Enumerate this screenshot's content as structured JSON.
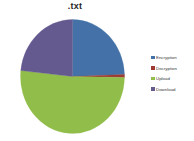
{
  "chart_data": {
    "type": "pie",
    "title": ".txt",
    "xlabel": "",
    "ylabel": "",
    "legend_position": "right",
    "grid": false,
    "categories": [
      "Encryption",
      "Decryption",
      "Upload",
      "Download"
    ],
    "values": [
      24.5,
      0.8,
      51.4,
      23.3
    ],
    "units": "percent",
    "colors": [
      "#4472a8",
      "#9e3a33",
      "#91bd4a",
      "#645a8f"
    ],
    "slices": [
      {
        "label": "Encryption",
        "value": 24.5,
        "color": "#4472a8",
        "start_angle_deg": 0,
        "end_angle_deg": 88
      },
      {
        "label": "Decryption",
        "value": 0.8,
        "color": "#9e3a33",
        "start_angle_deg": 88,
        "end_angle_deg": 91
      },
      {
        "label": "Upload",
        "value": 51.4,
        "color": "#91bd4a",
        "start_angle_deg": 91,
        "end_angle_deg": 276
      },
      {
        "label": "Download",
        "value": 23.3,
        "color": "#645a8f",
        "start_angle_deg": 276,
        "end_angle_deg": 360
      }
    ]
  },
  "chart": {
    "title": ".txt"
  },
  "legend": {
    "items": [
      {
        "label": "Encryption",
        "color": "#4472a8"
      },
      {
        "label": "Decryption",
        "color": "#9e3a33"
      },
      {
        "label": "Upload",
        "color": "#91bd4a"
      },
      {
        "label": "Download",
        "color": "#645a8f"
      }
    ]
  }
}
